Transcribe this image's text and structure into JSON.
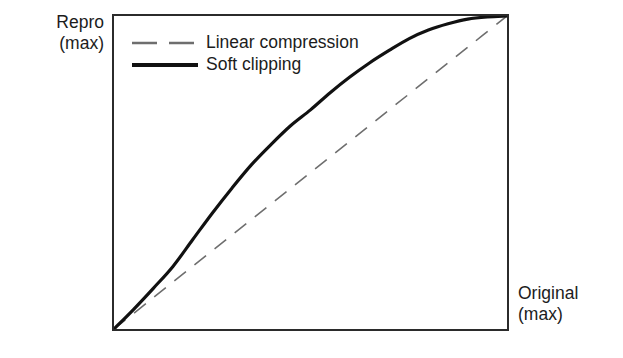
{
  "figure": {
    "background_color": "#ffffff",
    "frame_color": "#2b2b2b"
  },
  "axes": {
    "y_label_line1": "Repro",
    "y_label_line2": "(max)",
    "x_label_line1": "Original",
    "x_label_line2": "(max)"
  },
  "legend": {
    "position": "top-left-inside",
    "entries": [
      {
        "label": "Linear compression",
        "style": "dashed",
        "color": "#6e6e6e"
      },
      {
        "label": "Soft clipping",
        "style": "solid",
        "color": "#111111"
      }
    ]
  },
  "chart_data": {
    "type": "line",
    "title": "",
    "subtitle": "",
    "xlabel": "Original (max)",
    "ylabel": "Repro (max)",
    "xlim": [
      0,
      1
    ],
    "ylim": [
      0,
      1
    ],
    "grid": false,
    "x_ticks": [],
    "y_ticks": [],
    "legend_position": "upper left",
    "annotations": [],
    "series": [
      {
        "name": "Linear compression",
        "style": "dashed",
        "color": "#6e6e6e",
        "linewidth": 1.6,
        "x": [
          0.0,
          0.1,
          0.2,
          0.3,
          0.4,
          0.5,
          0.6,
          0.7,
          0.8,
          0.9,
          1.0
        ],
        "values": [
          0.0,
          0.1,
          0.2,
          0.3,
          0.4,
          0.5,
          0.6,
          0.7,
          0.8,
          0.9,
          1.0
        ]
      },
      {
        "name": "Soft clipping",
        "style": "solid",
        "color": "#111111",
        "linewidth": 3.2,
        "x": [
          0.0,
          0.05,
          0.1,
          0.15,
          0.2,
          0.25,
          0.3,
          0.35,
          0.4,
          0.45,
          0.5,
          0.55,
          0.6,
          0.65,
          0.7,
          0.75,
          0.8,
          0.85,
          0.9,
          0.95,
          1.0
        ],
        "values": [
          0.0,
          0.063,
          0.13,
          0.2,
          0.285,
          0.37,
          0.45,
          0.525,
          0.59,
          0.65,
          0.7,
          0.755,
          0.805,
          0.85,
          0.89,
          0.927,
          0.955,
          0.975,
          0.99,
          0.997,
          1.0
        ]
      }
    ]
  }
}
